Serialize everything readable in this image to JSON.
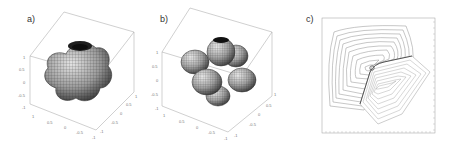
{
  "figure": {
    "panels": [
      {
        "label": "a)",
        "kind": "3d-surface",
        "shape": "smooth lobed blob",
        "axis_ticks": {
          "z": [
            "1",
            "0.5",
            "0",
            "-0.5",
            "-1"
          ],
          "x": [
            "1",
            "0.5",
            "0",
            "-0.5",
            "-1"
          ],
          "y": [
            "1",
            "0.5",
            "0",
            "-0.5",
            "-1"
          ]
        }
      },
      {
        "label": "b)",
        "kind": "3d-surface",
        "shape": "six-lobed flower (cubic harmonic)",
        "axis_ticks": {
          "z": [
            "1",
            "0.5",
            "0",
            "-0.5",
            "-1"
          ],
          "x": [
            "1",
            "0.5",
            "0",
            "-0.5",
            "-1"
          ],
          "y": [
            "1",
            "0.5",
            "0",
            "-0.5",
            "-1"
          ]
        }
      },
      {
        "label": "c)",
        "kind": "contour-plot",
        "shape": "two families of nested polygonal contours"
      }
    ],
    "colors": {
      "surface_dark": "#222222",
      "surface_mid": "#8a8a8a",
      "surface_light": "#d8d8d8",
      "box_line": "#9a9a9a",
      "contour_line": "#8f8f8f",
      "label_text": "#333333"
    }
  }
}
